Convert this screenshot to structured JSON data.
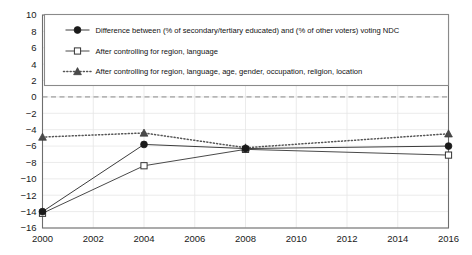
{
  "chart_data": {
    "type": "line",
    "title": "",
    "xlabel": "",
    "ylabel": "",
    "x": [
      2000,
      2004,
      2008,
      2016
    ],
    "xlim": [
      2000,
      2016
    ],
    "ylim": [
      -16,
      10
    ],
    "xticks": [
      "2000",
      "2002",
      "2004",
      "2006",
      "2008",
      "2010",
      "2012",
      "2014",
      "2016"
    ],
    "xtick_values": [
      2000,
      2002,
      2004,
      2006,
      2008,
      2010,
      2012,
      2014,
      2016
    ],
    "yticks": [
      "10",
      "8",
      "6",
      "4",
      "2",
      "0",
      "−2",
      "−4",
      "−6",
      "−8",
      "−10",
      "−12",
      "−14",
      "−16"
    ],
    "ytick_values": [
      10,
      8,
      6,
      4,
      2,
      0,
      -2,
      -4,
      -6,
      -8,
      -10,
      -12,
      -14,
      -16
    ],
    "grid": true,
    "legend_position": "upper-left-inside",
    "zero_reference_line": 0,
    "series": [
      {
        "name": "Difference between (% of secondary/tertiary educated) and (% of other voters) voting NDC",
        "marker": "filled-circle",
        "linestyle": "solid",
        "color": "#3c3c3c",
        "values": [
          -14.0,
          -5.8,
          -6.3,
          -6.0
        ]
      },
      {
        "name": "After controlling for region, language",
        "marker": "open-square",
        "linestyle": "solid",
        "color": "#4a4a4a",
        "values": [
          -14.2,
          -8.4,
          -6.4,
          -7.1
        ]
      },
      {
        "name": "After controlling for region, language, age, gender, occupation, religion, location",
        "marker": "filled-triangle",
        "linestyle": "dotted",
        "color": "#555555",
        "values": [
          -4.9,
          -4.4,
          -6.2,
          -4.5
        ]
      }
    ]
  },
  "colors": {
    "axis": "#6e6e6e",
    "grid": "#e6e6e6",
    "text": "#1a1a1a",
    "legend_border": "#8a8a8a",
    "zero_line": "#8a8a8a",
    "background": "#ffffff"
  }
}
